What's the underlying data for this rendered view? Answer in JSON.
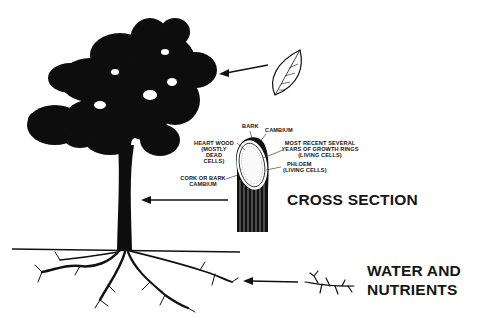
{
  "diagram": {
    "labels": {
      "bark": "BARK",
      "cambium": "CAMBIUM",
      "heart_wood": [
        "HEART WOOD",
        "(MOSTLY",
        "DEAD",
        "CELLS)"
      ],
      "growth_rings": [
        "MOST RECENT SEVERAL",
        "YEARS OF GROWTH RINGS",
        "(LIVING CELLS)"
      ],
      "phloem": [
        "PHLOEM",
        "(LIVING CELLS)"
      ],
      "cork_cambium": [
        "CORK OR BARK",
        "CAMBIUM"
      ],
      "cross_section": "CROSS SECTION",
      "water_nutrients": [
        "WATER AND",
        "NUTRIENTS"
      ]
    },
    "arrows": [
      {
        "from": "leaf",
        "to": "tree-canopy"
      },
      {
        "from": "cross-section",
        "to": "tree-trunk"
      },
      {
        "from": "root-detail",
        "to": "tree-roots"
      }
    ],
    "colors": {
      "ink": "#111111",
      "background": "#ffffff"
    }
  }
}
